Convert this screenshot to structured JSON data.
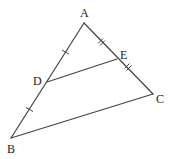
{
  "diagram": {
    "type": "geometry-triangle",
    "points": {
      "A": {
        "label": "A",
        "x": 84,
        "y": 23
      },
      "B": {
        "label": "B",
        "x": 11,
        "y": 138
      },
      "C": {
        "label": "C",
        "x": 153,
        "y": 94
      },
      "D": {
        "label": "D",
        "x": 47,
        "y": 82
      },
      "E": {
        "label": "E",
        "x": 117,
        "y": 59
      }
    },
    "segments": [
      "AB",
      "AC",
      "BC",
      "DE"
    ],
    "markings": {
      "AD_BD": "single tick (equal)",
      "AE_EC": "double tick (equal)"
    },
    "colors": {
      "stroke": "#444444",
      "label": "#222222",
      "background": "#ffffff"
    }
  }
}
